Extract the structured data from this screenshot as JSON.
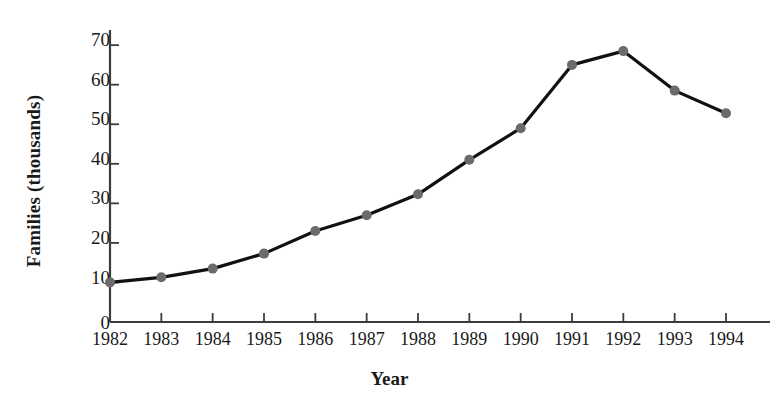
{
  "chart_data": {
    "type": "line",
    "title": "",
    "xlabel": "Year",
    "ylabel": "Families (thousands)",
    "categories": [
      "1982",
      "1983",
      "1984",
      "1985",
      "1986",
      "1987",
      "1988",
      "1989",
      "1990",
      "1991",
      "1992",
      "1993",
      "1994"
    ],
    "values": [
      10,
      11.3,
      13.5,
      17.3,
      23,
      27,
      32.3,
      41,
      49,
      65,
      68.5,
      58.5,
      52.8
    ],
    "series": [
      {
        "name": "Families",
        "values": [
          10,
          11.3,
          13.5,
          17.3,
          23,
          27,
          32.3,
          41,
          49,
          65,
          68.5,
          58.5,
          52.8
        ]
      }
    ],
    "ylim": [
      0,
      75
    ],
    "xlim": [
      "1982",
      "1994"
    ],
    "yticks": [
      0,
      10,
      20,
      30,
      40,
      50,
      60,
      70
    ],
    "ytick_labels": [
      "0",
      "10",
      "20",
      "30",
      "40",
      "50",
      "60",
      "70"
    ],
    "xtick_labels": [
      "1982",
      "1983",
      "1984",
      "1985",
      "1986",
      "1987",
      "1988",
      "1989",
      "1990",
      "1991",
      "1992",
      "1993",
      "1994"
    ],
    "grid": false,
    "legend": false,
    "legend_position": "none",
    "marker": "circle",
    "marker_color": "#6b6b6b",
    "line_color": "#111111",
    "axis_color": "#3c3c3c",
    "background_color": "#ffffff"
  }
}
